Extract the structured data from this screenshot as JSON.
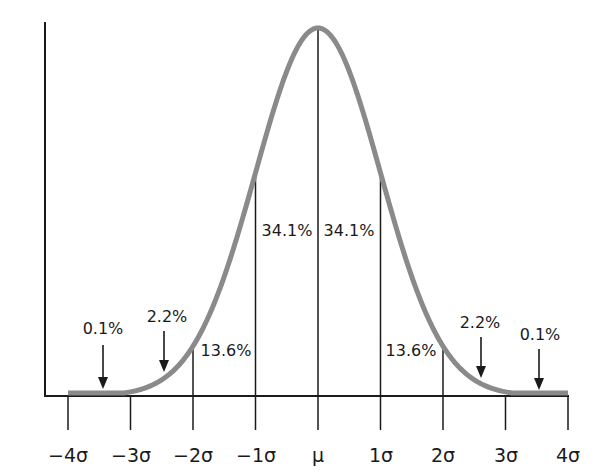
{
  "chart_data": {
    "type": "line",
    "title": "",
    "xlabel": "",
    "ylabel": "",
    "x_ticks": [
      "-4σ",
      "-3σ",
      "-2σ",
      "-1σ",
      "μ",
      "1σ",
      "2σ",
      "3σ",
      "4σ"
    ],
    "x_tick_values": [
      -4,
      -3,
      -2,
      -1,
      0,
      1,
      2,
      3,
      4
    ],
    "xlim": [
      -4,
      4
    ],
    "grid": false,
    "legend": null,
    "series": [
      {
        "name": "normal density",
        "function": "exp(-x^2/2)",
        "color": "#8a8a8a"
      }
    ],
    "bands": [
      {
        "from": -4,
        "to": -3,
        "label": "0.1%",
        "style": "arrow"
      },
      {
        "from": -3,
        "to": -2,
        "label": "2.2%",
        "style": "arrow"
      },
      {
        "from": -2,
        "to": -1,
        "label": "13.6%",
        "style": "inside"
      },
      {
        "from": -1,
        "to": 0,
        "label": "34.1%",
        "style": "inside"
      },
      {
        "from": 0,
        "to": 1,
        "label": "34.1%",
        "style": "inside"
      },
      {
        "from": 1,
        "to": 2,
        "label": "13.6%",
        "style": "inside"
      },
      {
        "from": 2,
        "to": 3,
        "label": "2.2%",
        "style": "arrow"
      },
      {
        "from": 3,
        "to": 4,
        "label": "0.1%",
        "style": "arrow"
      }
    ]
  },
  "colors": {
    "curve": "#8a8a8a",
    "axes": "#1a1a1a",
    "text": "#1a1a1a",
    "background": "#ffffff"
  },
  "labels": {
    "ticks": [
      "−4σ",
      "−3σ",
      "−2σ",
      "−1σ",
      "μ",
      "1σ",
      "2σ",
      "3σ",
      "4σ"
    ],
    "band_left_0_1": "0.1%",
    "band_left_2_2": "2.2%",
    "band_left_13_6": "13.6%",
    "band_left_34_1": "34.1%",
    "band_right_34_1": "34.1%",
    "band_right_13_6": "13.6%",
    "band_right_2_2": "2.2%",
    "band_right_0_1": "0.1%"
  }
}
